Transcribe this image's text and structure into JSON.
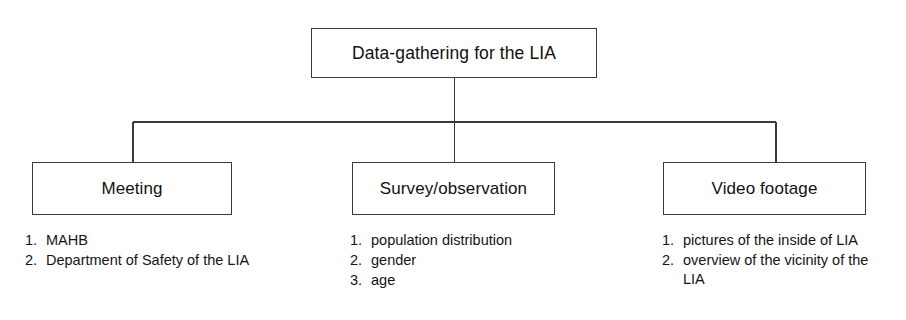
{
  "diagram": {
    "type": "hierarchy-tree",
    "line_color": "#3a3a3a",
    "background_color": "#ffffff",
    "root": {
      "label": "Data-gathering for the LIA"
    },
    "children": [
      {
        "label": "Meeting",
        "items": [
          {
            "index": "1.",
            "text": "MAHB"
          },
          {
            "index": "2.",
            "text": "Department of Safety of the LIA"
          }
        ]
      },
      {
        "label": "Survey/observation",
        "items": [
          {
            "index": "1.",
            "text": "population distribution"
          },
          {
            "index": "2.",
            "text": "gender"
          },
          {
            "index": "3.",
            "text": "age"
          }
        ]
      },
      {
        "label": "Video footage",
        "items": [
          {
            "index": "1.",
            "text": "pictures of the inside of LIA"
          },
          {
            "index": "2.",
            "text": "overview of the vicinity of the LIA"
          }
        ]
      }
    ]
  }
}
